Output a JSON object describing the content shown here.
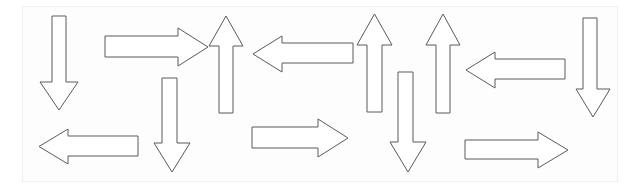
{
  "figure": {
    "canvas": {
      "width": 642,
      "height": 194
    },
    "frame": {
      "x": 22,
      "y": 6,
      "width": 596,
      "height": 176,
      "border_color": "#f0f0f0",
      "fill_color": "#fdfdfd"
    },
    "style": {
      "stroke_color": "#5a5a5a",
      "fill_color": "#ffffff",
      "stroke_width": 1
    },
    "counts": {
      "up": 3,
      "down": 4,
      "left": 3,
      "right": 3,
      "total": 12
    }
  },
  "arrows": [
    {
      "id": "arrow-1",
      "label": "down-arrow-1",
      "direction": "down",
      "shaft_x1": 52,
      "shaft_x2": 66,
      "head_x1": 40,
      "head_x2": 78,
      "y_start": 16,
      "y_tip": 110,
      "head_y": 82
    },
    {
      "id": "arrow-2",
      "label": "right-arrow-1",
      "direction": "right",
      "shaft_y1": 36,
      "shaft_y2": 57,
      "head_y1": 28,
      "head_y2": 66,
      "x_start": 105,
      "x_tip": 208,
      "head_x": 178
    },
    {
      "id": "arrow-3",
      "label": "up-arrow-1",
      "direction": "up",
      "shaft_x1": 219,
      "shaft_x2": 233,
      "head_x1": 209,
      "head_x2": 243,
      "y_start": 113,
      "y_tip": 16,
      "head_y": 46
    },
    {
      "id": "arrow-4",
      "label": "left-arrow-1",
      "direction": "left",
      "shaft_y1": 43,
      "shaft_y2": 63,
      "head_y1": 36,
      "head_y2": 72,
      "x_start": 353,
      "x_tip": 253,
      "head_x": 282
    },
    {
      "id": "arrow-5",
      "label": "up-arrow-2",
      "direction": "up",
      "shaft_x1": 367,
      "shaft_x2": 382,
      "head_x1": 357,
      "head_x2": 392,
      "y_start": 112,
      "y_tip": 14,
      "head_y": 45
    },
    {
      "id": "arrow-6",
      "label": "up-arrow-3",
      "direction": "up",
      "shaft_x1": 436,
      "shaft_x2": 450,
      "head_x1": 426,
      "head_x2": 460,
      "y_start": 113,
      "y_tip": 14,
      "head_y": 45
    },
    {
      "id": "arrow-7",
      "label": "left-arrow-2",
      "direction": "left",
      "shaft_y1": 59,
      "shaft_y2": 79,
      "head_y1": 52,
      "head_y2": 88,
      "x_start": 565,
      "x_tip": 466,
      "head_x": 495
    },
    {
      "id": "arrow-8",
      "label": "down-arrow-2",
      "direction": "down",
      "shaft_x1": 583,
      "shaft_x2": 597,
      "head_x1": 576,
      "head_x2": 610,
      "y_start": 18,
      "y_tip": 117,
      "head_y": 89
    },
    {
      "id": "arrow-9",
      "label": "down-arrow-3",
      "direction": "down",
      "shaft_x1": 162,
      "shaft_x2": 177,
      "head_x1": 154,
      "head_x2": 190,
      "y_start": 78,
      "y_tip": 172,
      "head_y": 143
    },
    {
      "id": "arrow-10",
      "label": "down-arrow-4",
      "direction": "down",
      "shaft_x1": 398,
      "shaft_x2": 413,
      "head_x1": 390,
      "head_x2": 426,
      "y_start": 72,
      "y_tip": 172,
      "head_y": 142
    },
    {
      "id": "arrow-11",
      "label": "left-arrow-3",
      "direction": "left",
      "shaft_y1": 136,
      "shaft_y2": 156,
      "head_y1": 129,
      "head_y2": 164,
      "x_start": 138,
      "x_tip": 39,
      "head_x": 68
    },
    {
      "id": "arrow-12",
      "label": "right-arrow-2",
      "direction": "right",
      "shaft_y1": 127,
      "shaft_y2": 148,
      "head_y1": 119,
      "head_y2": 157,
      "x_start": 252,
      "x_tip": 348,
      "head_x": 318
    },
    {
      "id": "arrow-13",
      "label": "right-arrow-3",
      "direction": "right",
      "shaft_y1": 140,
      "shaft_y2": 159,
      "head_y1": 132,
      "head_y2": 168,
      "x_start": 465,
      "x_tip": 568,
      "head_x": 538
    }
  ]
}
